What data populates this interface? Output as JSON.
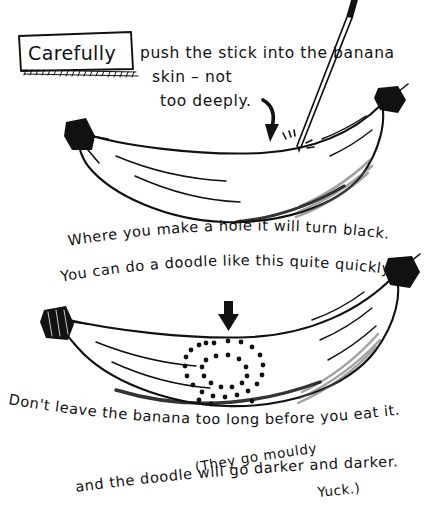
{
  "page": {
    "title": "Carefully push the stick into the banana",
    "background_color": "#ffffff",
    "ink_color": "#111111",
    "width": 436,
    "height": 514
  },
  "step1": {
    "badge_label": "Carefully",
    "line1": "push the stick into the banana",
    "line2": "skin – not",
    "line3": "too deeply.",
    "arrow_icon": "curved-down-arrow-icon",
    "stick_icon": "wooden-stick-icon",
    "impact_icon": "impact-marks-icon"
  },
  "step2": {
    "line1": "Where you make a hole it will turn black.",
    "line2": "You can do a doodle like this quite quickly.",
    "arrow_icon": "down-arrow-icon"
  },
  "step3": {
    "line1": "Don't leave the banana too long before you eat it.",
    "line2": "and the doodle will go darker and darker.",
    "aside_line1": "(They go mouldy",
    "aside_line2": "Yuck.)"
  },
  "bananas": [
    {
      "name": "top-banana",
      "state": "with-stick",
      "tip_color": "#111111"
    },
    {
      "name": "bottom-banana",
      "state": "with-dot-doodle",
      "tip_color": "#111111"
    }
  ],
  "doodle": {
    "name": "spiral-dot-doodle",
    "shape": "spiral",
    "outer_dots": 22,
    "inner_dots": 13,
    "dot_color": "#111111"
  }
}
